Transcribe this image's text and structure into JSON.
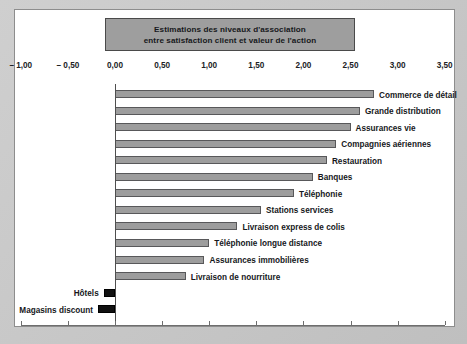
{
  "title": {
    "line1": "Estimations des niveaux d'association",
    "line2": "entre satisfaction client et valeur de l'action"
  },
  "colors": {
    "positive_bar": "#9d9d9d",
    "negative_bar": "#111111",
    "bar_border": "#58585a",
    "title_box_fill": "#9e9e9e",
    "panel_background": "#ffffff",
    "frame_background": "#c4c4c4",
    "axis": "#6e6e6e",
    "text": "#16181b"
  },
  "axis": {
    "tick_labels": [
      "– 1,00",
      "– 0,50",
      "0,00",
      "0,50",
      "1,00",
      "1,50",
      "2,00",
      "2,50",
      "3,00",
      "3,50"
    ],
    "tick_values": [
      -1.0,
      -0.5,
      0.0,
      0.5,
      1.0,
      1.5,
      2.0,
      2.5,
      3.0,
      3.5
    ],
    "min": -1.0,
    "max": 3.5,
    "step": 0.5
  },
  "chart_data": {
    "type": "bar",
    "orientation": "horizontal",
    "title": "Estimations des niveaux d'association entre satisfaction client et valeur de l'action",
    "xlabel": "",
    "ylabel": "",
    "xlim": [
      -1.0,
      3.5
    ],
    "grid": false,
    "legend": "none",
    "categories": [
      "Commerce de détail",
      "Grande distribution",
      "Assurances vie",
      "Compagnies aériennes",
      "Restauration",
      "Banques",
      "Téléphonie",
      "Stations services",
      "Livraison express de colis",
      "Téléphonie longue distance",
      "Assurances immobilières",
      "Livraison de nourriture",
      "Hôtels",
      "Magasins discount"
    ],
    "values": [
      2.75,
      2.6,
      2.5,
      2.35,
      2.25,
      2.1,
      1.9,
      1.55,
      1.3,
      1.0,
      0.95,
      0.75,
      -0.12,
      -0.18
    ]
  },
  "bars": [
    {
      "label": "Commerce de détail",
      "value": 2.75,
      "sign": "positive"
    },
    {
      "label": "Grande distribution",
      "value": 2.6,
      "sign": "positive"
    },
    {
      "label": "Assurances vie",
      "value": 2.5,
      "sign": "positive"
    },
    {
      "label": "Compagnies aériennes",
      "value": 2.35,
      "sign": "positive"
    },
    {
      "label": "Restauration",
      "value": 2.25,
      "sign": "positive"
    },
    {
      "label": "Banques",
      "value": 2.1,
      "sign": "positive"
    },
    {
      "label": "Téléphonie",
      "value": 1.9,
      "sign": "positive"
    },
    {
      "label": "Stations services",
      "value": 1.55,
      "sign": "positive"
    },
    {
      "label": "Livraison express de colis",
      "value": 1.3,
      "sign": "positive"
    },
    {
      "label": "Téléphonie longue distance",
      "value": 1.0,
      "sign": "positive"
    },
    {
      "label": "Assurances immobilières",
      "value": 0.95,
      "sign": "positive"
    },
    {
      "label": "Livraison de nourriture",
      "value": 0.75,
      "sign": "positive"
    },
    {
      "label": "Hôtels",
      "value": -0.12,
      "sign": "negative"
    },
    {
      "label": "Magasins discount",
      "value": -0.18,
      "sign": "negative"
    }
  ]
}
